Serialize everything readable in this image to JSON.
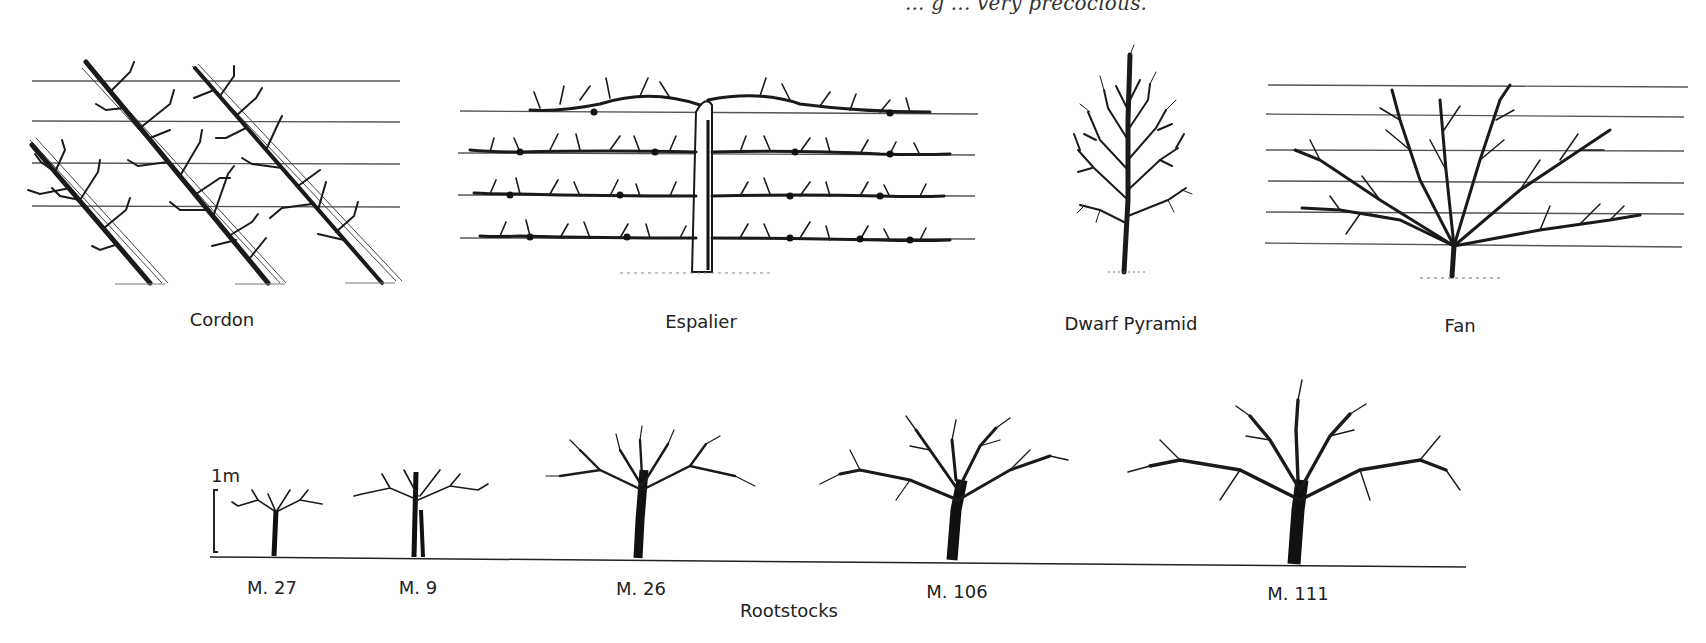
{
  "caption_fragment": "... g ... very precocious.",
  "training_forms": [
    {
      "id": "cordon",
      "label": "Cordon"
    },
    {
      "id": "espalier",
      "label": "Espalier"
    },
    {
      "id": "dwarf-pyramid",
      "label": "Dwarf Pyramid"
    },
    {
      "id": "fan",
      "label": "Fan"
    }
  ],
  "rootstocks": {
    "title": "Rootstocks",
    "scale_label": "1m",
    "items": [
      {
        "label": "M. 27"
      },
      {
        "label": "M. 9"
      },
      {
        "label": "M. 26"
      },
      {
        "label": "M. 106"
      },
      {
        "label": "M. 111"
      }
    ]
  }
}
